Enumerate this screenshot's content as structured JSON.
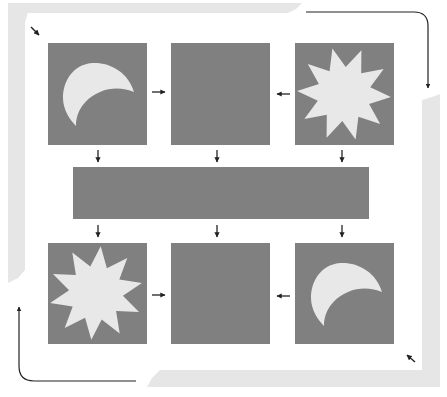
{
  "diagram": {
    "colors": {
      "background": "#ffffff",
      "frame": "#e6e6e6",
      "tile": "#808080",
      "shape": "#e8e8e8",
      "arrow": "#222222"
    },
    "top_row": [
      {
        "id": "top-left",
        "shape": "crescent-moon",
        "orientation": "opens-bottom-right"
      },
      {
        "id": "top-middle",
        "shape": "empty"
      },
      {
        "id": "top-right",
        "shape": "starburst",
        "points": 10
      }
    ],
    "middle_bar": {
      "id": "middle-bar",
      "shape": "empty"
    },
    "bottom_row": [
      {
        "id": "bottom-left",
        "shape": "starburst",
        "points": 10
      },
      {
        "id": "bottom-middle",
        "shape": "empty"
      },
      {
        "id": "bottom-right",
        "shape": "crescent-moon",
        "orientation": "opens-bottom-right"
      }
    ],
    "arrows": [
      {
        "from": "top-left",
        "to": "top-middle",
        "direction": "right"
      },
      {
        "from": "top-right",
        "to": "top-middle",
        "direction": "left"
      },
      {
        "from": "top-left",
        "to": "middle-bar",
        "direction": "down"
      },
      {
        "from": "top-middle",
        "to": "middle-bar",
        "direction": "down"
      },
      {
        "from": "top-right",
        "to": "middle-bar",
        "direction": "down"
      },
      {
        "from": "middle-bar",
        "to": "bottom-left",
        "direction": "down"
      },
      {
        "from": "middle-bar",
        "to": "bottom-middle",
        "direction": "down"
      },
      {
        "from": "middle-bar",
        "to": "bottom-right",
        "direction": "down"
      },
      {
        "from": "bottom-left",
        "to": "bottom-middle",
        "direction": "right"
      },
      {
        "from": "bottom-right",
        "to": "bottom-middle",
        "direction": "left"
      },
      {
        "type": "corner-pointer",
        "corner": "top-left",
        "direction": "down-right"
      },
      {
        "type": "corner-pointer",
        "corner": "bottom-right",
        "direction": "up-left"
      },
      {
        "type": "elbow",
        "corner": "top-right",
        "direction": "right-then-down"
      },
      {
        "type": "elbow",
        "corner": "bottom-left",
        "direction": "left-then-up"
      }
    ]
  }
}
